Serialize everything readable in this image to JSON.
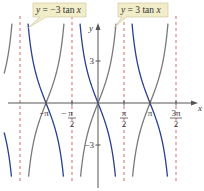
{
  "chart_data": {
    "type": "line",
    "title": "",
    "xlabel": "x",
    "ylabel": "y",
    "xlim": [
      -3.77,
      4.9
    ],
    "ylim": [
      -6.0,
      5.8
    ],
    "grid": false,
    "x_ticks": [
      {
        "value": -3.14159,
        "label_num": "−π",
        "label_den": ""
      },
      {
        "value": -1.5708,
        "label_num": "−  π",
        "label_den": "2"
      },
      {
        "value": 1.5708,
        "label_num": "π",
        "label_den": "2"
      },
      {
        "value": 3.14159,
        "label_num": "π",
        "label_den": ""
      },
      {
        "value": 4.71239,
        "label_num": "3π",
        "label_den": "2"
      }
    ],
    "y_ticks": [
      {
        "value": 3,
        "label": "3"
      },
      {
        "value": -3,
        "label": "−3"
      }
    ],
    "asymptotes": [
      -4.71239,
      -1.5708,
      1.5708,
      4.71239
    ],
    "series": [
      {
        "name": "y = −3 tan x",
        "coef": -3,
        "color": "#2b3f8f"
      },
      {
        "name": "y = 3 tan x",
        "coef": 3,
        "color": "#7a7a7a"
      }
    ],
    "annotations": [
      {
        "text_pre": "y",
        "text_post": " = −3 tan ",
        "text_var": "x",
        "target_series": "y = −3 tan x"
      },
      {
        "text_pre": "y",
        "text_post": " = 3 tan ",
        "text_var": "x",
        "target_series": "y = 3 tan x"
      }
    ],
    "colors": {
      "axis": "#555555",
      "asymptote": "#d46a6a",
      "callout_bg": "#f1edc8",
      "callout_border": "#c9c39a"
    }
  }
}
